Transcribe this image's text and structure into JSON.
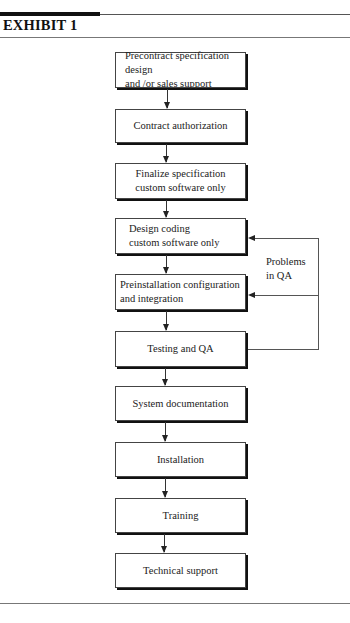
{
  "exhibit": {
    "title": "EXHIBIT 1"
  },
  "flowchart": {
    "steps": [
      {
        "label": "Precontract specification design\nand /or sales support"
      },
      {
        "label": "Contract authorization"
      },
      {
        "label": "Finalize specification\ncustom software only"
      },
      {
        "label": "Design coding\ncustom software only"
      },
      {
        "label": "Preinstallation configuration\nand integration"
      },
      {
        "label": "Testing and QA"
      },
      {
        "label": "System documentation"
      },
      {
        "label": "Installation"
      },
      {
        "label": "Training"
      },
      {
        "label": "Technical support"
      }
    ],
    "feedback": {
      "label": "Problems\nin QA",
      "from_step": "Testing and QA",
      "to_steps": [
        "Design coding\ncustom software only",
        "Preinstallation configuration\nand integration"
      ]
    }
  }
}
